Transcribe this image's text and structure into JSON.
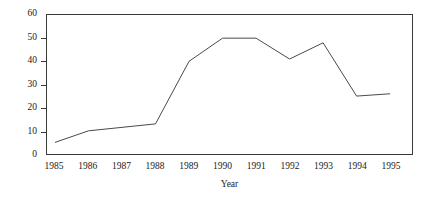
{
  "chart_data": {
    "type": "line",
    "title": "",
    "xlabel": "Year",
    "ylabel": "",
    "x": [
      1985,
      1986,
      1987,
      1988,
      1989,
      1990,
      1991,
      1992,
      1993,
      1994,
      1995
    ],
    "xticklabels": [
      "1985",
      "1986",
      "1987",
      "1988",
      "1989",
      "1990",
      "1991",
      "1992",
      "1993",
      "1994",
      "1995"
    ],
    "values": [
      5,
      10,
      11.5,
      13,
      40,
      50,
      50,
      41,
      48,
      25,
      26
    ],
    "yticks": [
      0,
      10,
      20,
      30,
      40,
      50,
      60
    ],
    "yticklabels": [
      "0",
      "10",
      "20",
      "30",
      "40",
      "50",
      "60"
    ],
    "ylim": [
      0,
      60
    ],
    "xlim": [
      1985,
      1995
    ],
    "grid": false,
    "legend": false,
    "line_color": "#4a4a4a",
    "frame_color": "#3a3a3a",
    "background_color": "#ffffff"
  }
}
